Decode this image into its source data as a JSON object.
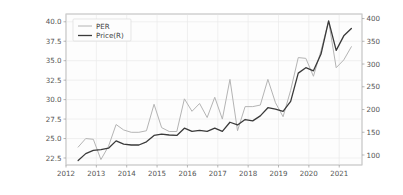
{
  "cell": {
    "out_prompt": "Out"
  },
  "chart_data": {
    "type": "line",
    "title": "",
    "xlabel": "",
    "ylabel": "",
    "grid": true,
    "legend_position": "upper-left",
    "x": [
      2012.4,
      2012.65,
      2012.9,
      2013.15,
      2013.4,
      2013.65,
      2013.9,
      2014.15,
      2014.4,
      2014.65,
      2014.9,
      2015.15,
      2015.4,
      2015.65,
      2015.9,
      2016.15,
      2016.4,
      2016.65,
      2016.9,
      2017.15,
      2017.4,
      2017.65,
      2017.9,
      2018.15,
      2018.4,
      2018.65,
      2018.9,
      2019.15,
      2019.4,
      2019.65,
      2019.9,
      2020.15,
      2020.4,
      2020.65,
      2020.9,
      2021.15,
      2021.4
    ],
    "xlim": [
      2012.0,
      2021.75
    ],
    "xticks": [
      2012,
      2013,
      2014,
      2015,
      2016,
      2017,
      2018,
      2019,
      2020,
      2021
    ],
    "xtick_labels": [
      "2012",
      "2013",
      "2014",
      "2015",
      "2016",
      "2017",
      "2018",
      "2019",
      "2020",
      "2021"
    ],
    "axes": [
      {
        "id": "left",
        "label": "PER",
        "lim": [
          21.6,
          41.0
        ],
        "ticks": [
          22.5,
          25.0,
          27.5,
          30.0,
          32.5,
          35.0,
          37.5,
          40.0
        ],
        "tick_labels": [
          "22.5",
          "25.0",
          "27.5",
          "30.0",
          "32.5",
          "35.0",
          "37.5",
          "40.0"
        ]
      },
      {
        "id": "right",
        "label": "Price(R)",
        "lim": [
          78,
          410
        ],
        "ticks": [
          100,
          150,
          200,
          250,
          300,
          350,
          400
        ],
        "tick_labels": [
          "100",
          "150",
          "200",
          "250",
          "300",
          "350",
          "400"
        ]
      }
    ],
    "series": [
      {
        "name": "PER",
        "axis": "left",
        "color": "#b4b4b4",
        "linewidth": 1.0,
        "values": [
          23.9,
          25.0,
          24.9,
          22.3,
          24.0,
          26.8,
          26.1,
          25.8,
          25.8,
          26.0,
          29.4,
          26.4,
          25.9,
          25.9,
          30.1,
          28.5,
          29.5,
          27.7,
          30.3,
          27.5,
          32.6,
          26.0,
          29.1,
          29.1,
          29.3,
          32.6,
          29.6,
          27.8,
          31.2,
          35.4,
          35.3,
          33.0,
          36.3,
          40.1,
          34.1,
          35.1,
          36.8
        ]
      },
      {
        "name": "Price(R)",
        "axis": "right",
        "color": "#3a3a3a",
        "linewidth": 1.3,
        "values": [
          88,
          103,
          110,
          112,
          115,
          131,
          124,
          122,
          122,
          129,
          143,
          146,
          144,
          143,
          159,
          152,
          154,
          152,
          159,
          152,
          172,
          166,
          178,
          175,
          186,
          204,
          201,
          196,
          218,
          280,
          292,
          285,
          322,
          395,
          330,
          362,
          378
        ]
      }
    ]
  }
}
